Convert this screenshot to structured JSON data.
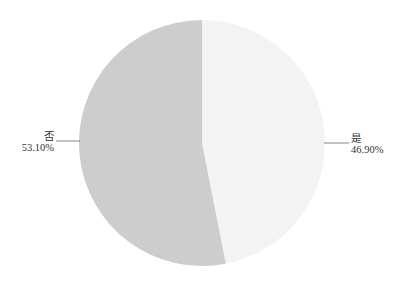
{
  "chart_data": {
    "type": "pie",
    "title": "",
    "categories": [
      "是",
      "否"
    ],
    "values": [
      46.9,
      53.1
    ],
    "value_labels": [
      "46.90%",
      "53.10%"
    ],
    "colors": [
      "#f3f3f3",
      "#cdcdcd"
    ],
    "start_angle_deg": 90,
    "direction": "clockwise",
    "legend": "none",
    "label_position": "outside-with-leader-lines"
  },
  "labels": {
    "yes": {
      "name": "是",
      "pct": "46.90%"
    },
    "no": {
      "name": "否",
      "pct": "53.10%"
    }
  }
}
